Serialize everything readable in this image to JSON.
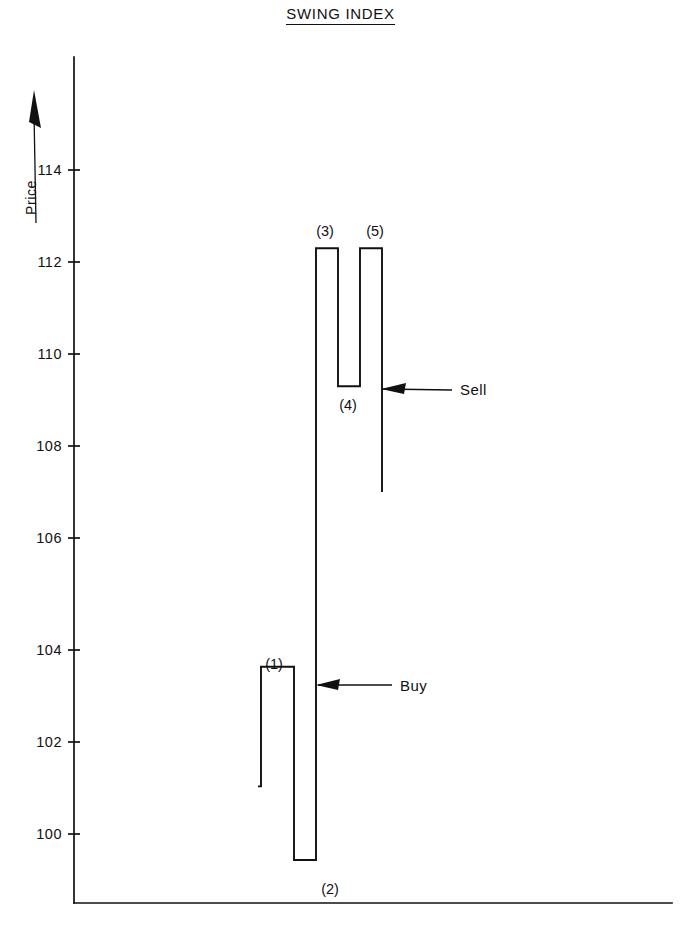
{
  "chart_data": {
    "type": "line",
    "title": "SWING INDEX",
    "xlabel": "",
    "ylabel": "Price",
    "ylim": [
      98.0,
      115.2
    ],
    "yticks": [
      100,
      102,
      104,
      106,
      108,
      110,
      112,
      114
    ],
    "ytick_labels": [
      "100",
      "102",
      "104",
      "106",
      "108",
      "110",
      "112",
      "114"
    ],
    "grid": false,
    "legend": "none",
    "x": [
      0,
      1,
      2,
      3,
      4,
      5,
      6
    ],
    "values": [
      100.6,
      103.2,
      99.0,
      112.3,
      109.3,
      112.3,
      107.0
    ],
    "point_labels": [
      "",
      "(1)",
      "(2)",
      "(3)",
      "(4)",
      "(5)",
      ""
    ],
    "series": [
      {
        "name": "Swing Index",
        "values": [
          100.6,
          103.2,
          99.0,
          112.3,
          109.3,
          112.3,
          107.0
        ]
      }
    ],
    "annotations": [
      {
        "label": "Buy",
        "value": 102.8,
        "pointer": "left-arrow"
      },
      {
        "label": "Sell",
        "value": 109.25,
        "pointer": "left-arrow"
      }
    ]
  },
  "labels": {
    "point_1": "(1)",
    "point_2": "(2)",
    "point_3": "(3)",
    "point_4": "(4)",
    "point_5": "(5)",
    "y_axis_title": "Price",
    "tick_100": "100",
    "tick_102": "102",
    "tick_104": "104",
    "tick_106": "106",
    "tick_108": "108",
    "tick_110": "110",
    "tick_112": "112",
    "tick_114": "114",
    "annot_buy": "Buy",
    "annot_sell": "Sell"
  },
  "colors": {
    "ink": "#111111",
    "paper": "#ffffff"
  }
}
